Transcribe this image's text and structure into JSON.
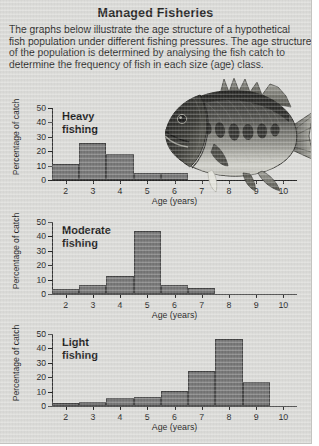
{
  "title": "Managed Fisheries",
  "intro_lines": [
    "The graphs below illustrate the age structure of a hypothetical",
    "fish population under different fishing pressures. The age structure",
    "of the population is determined by analysing the fish catch to",
    "determine the frequency of fish in each size (age) class."
  ],
  "photo": {
    "name": "fish-photograph",
    "subject": "bass fish side view"
  },
  "colors": {
    "page_background": "#d9d9d6",
    "bar_fill": "#6f6f6f",
    "bar_outline": "#3b3b3b",
    "axis": "#1d1d1d",
    "text": "#111111"
  },
  "axis_common": {
    "ylabel": "Percentage of catch",
    "xlabel": "Age (years)",
    "yticks": [
      0,
      10,
      20,
      30,
      40,
      50
    ],
    "ylim": [
      0,
      50
    ],
    "categories": [
      2,
      3,
      4,
      5,
      6,
      7,
      8,
      9,
      10
    ],
    "grid": false
  },
  "chart_data": [
    {
      "type": "bar",
      "id": "heavy",
      "title": "Heavy\nfishing",
      "caption_line1": "Heavy",
      "caption_line2": "fishing",
      "xlabel": "Age (years)",
      "ylabel": "Percentage of catch",
      "categories": [
        2,
        3,
        4,
        5,
        6,
        7,
        8,
        9,
        10
      ],
      "values": [
        11,
        26,
        18,
        5,
        5,
        0,
        0,
        0,
        0
      ],
      "ylim": [
        0,
        50
      ],
      "yticks": [
        0,
        10,
        20,
        30,
        40,
        50
      ],
      "grid": false,
      "legend": "none"
    },
    {
      "type": "bar",
      "id": "moderate",
      "title": "Moderate\nfishing",
      "caption_line1": "Moderate",
      "caption_line2": "fishing",
      "xlabel": "Age (years)",
      "ylabel": "Percentage of catch",
      "categories": [
        2,
        3,
        4,
        5,
        6,
        7,
        8,
        9,
        10
      ],
      "values": [
        3.5,
        6.5,
        12.5,
        44,
        6.5,
        4.5,
        0,
        0,
        0
      ],
      "ylim": [
        0,
        50
      ],
      "yticks": [
        0,
        10,
        20,
        30,
        40,
        50
      ],
      "grid": false,
      "legend": "none"
    },
    {
      "type": "bar",
      "id": "light",
      "title": "Light\nfishing",
      "caption_line1": "Light",
      "caption_line2": "fishing",
      "xlabel": "Age (years)",
      "ylabel": "Percentage of catch",
      "categories": [
        2,
        3,
        4,
        5,
        6,
        7,
        8,
        9,
        10
      ],
      "values": [
        2,
        3,
        5.5,
        6.5,
        10.5,
        24,
        46.5,
        17,
        0
      ],
      "ylim": [
        0,
        50
      ],
      "yticks": [
        0,
        10,
        20,
        30,
        40,
        50
      ],
      "grid": false,
      "legend": "none"
    }
  ]
}
